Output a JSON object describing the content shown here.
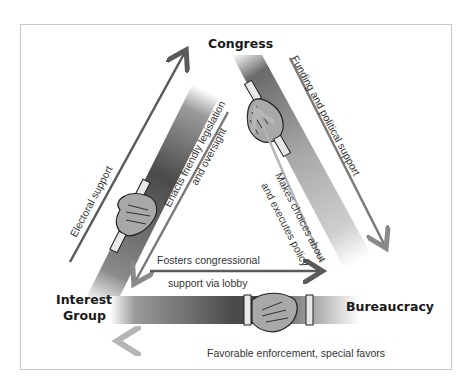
{
  "nodes": {
    "congress": "Congress",
    "interest_group_line1": "Interest",
    "interest_group_line2": "Group",
    "bureaucracy": "Bureaucracy"
  },
  "edges": {
    "electoral_support": "Electoral support",
    "enacts_line1": "Enacts friendly legislation",
    "enacts_line2": "and oversight",
    "funding": "Funding and political support",
    "makes_line1": "Makes choices about",
    "makes_line2": "and executes policy",
    "fosters_line1": "Fosters congressional",
    "fosters_line2": "support via lobby",
    "favorable": "Favorable enforcement, special favors"
  },
  "colors": {
    "arm_dark": "#4a4a4a",
    "arm_light": "#d0d0d0",
    "hand_fill": "#a8a8a8",
    "arrow_dark": "#5a5a5a",
    "arrow_light": "#b0b0b0"
  }
}
